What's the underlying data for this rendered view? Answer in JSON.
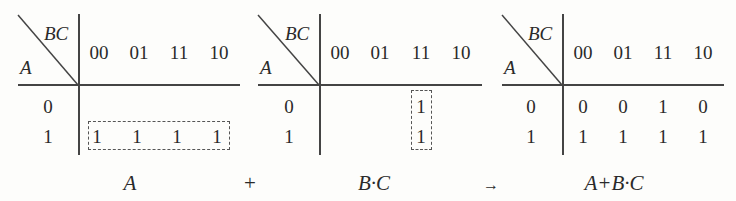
{
  "maps": [
    {
      "id": "map-A",
      "col_var": "BC",
      "row_var": "A",
      "col_headers": [
        "00",
        "01",
        "11",
        "10"
      ],
      "row_headers": [
        "0",
        "1"
      ],
      "cells": [
        [
          "",
          "",
          "",
          ""
        ],
        [
          "1",
          "1",
          "1",
          "1"
        ]
      ],
      "grouping": "row A=1, all columns"
    },
    {
      "id": "map-BC",
      "col_var": "BC",
      "row_var": "A",
      "col_headers": [
        "00",
        "01",
        "11",
        "10"
      ],
      "row_headers": [
        "0",
        "1"
      ],
      "cells": [
        [
          "",
          "",
          "1",
          ""
        ],
        [
          "",
          "",
          "1",
          ""
        ]
      ],
      "grouping": "column BC=11, both rows"
    },
    {
      "id": "map-result",
      "col_var": "BC",
      "row_var": "A",
      "col_headers": [
        "00",
        "01",
        "11",
        "10"
      ],
      "row_headers": [
        "0",
        "1"
      ],
      "cells": [
        [
          "0",
          "0",
          "1",
          "0"
        ],
        [
          "1",
          "1",
          "1",
          "1"
        ]
      ],
      "grouping": ""
    }
  ],
  "expression": {
    "term1": "A",
    "plus": "+",
    "term2": "B·C",
    "arrow": "→",
    "result": "A+B·C"
  }
}
